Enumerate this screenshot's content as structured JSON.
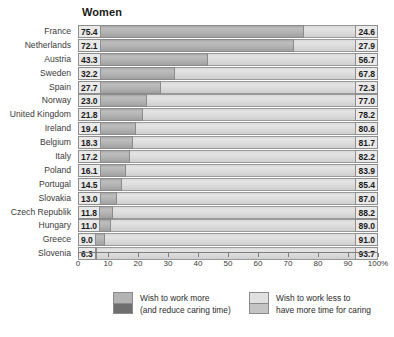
{
  "chart_data": {
    "type": "bar",
    "title": "Women",
    "xlabel": "",
    "ylabel": "",
    "xlim": [
      0,
      100
    ],
    "grid": false,
    "orientation": "horizontal",
    "stacked": true,
    "legend_position": "bottom",
    "axis_unit": "%",
    "categories": [
      "France",
      "Netherlands",
      "Austria",
      "Sweden",
      "Spain",
      "Norway",
      "United Kingdom",
      "Ireland",
      "Belgium",
      "Italy",
      "Poland",
      "Portugal",
      "Slovakia",
      "Czech Republik",
      "Hungary",
      "Greece",
      "Slovenia"
    ],
    "tick_labels": [
      "0",
      "10",
      "20",
      "30",
      "40",
      "50",
      "60",
      "70",
      "80",
      "90",
      "100%"
    ],
    "tick_values": [
      0,
      10,
      20,
      30,
      40,
      50,
      60,
      70,
      80,
      90,
      100
    ],
    "series": [
      {
        "name": "Wish to work more (and reduce caring time)",
        "color": "#b0b0b0",
        "values": [
          75.4,
          72.1,
          43.3,
          32.2,
          27.7,
          23.0,
          21.8,
          19.4,
          18.3,
          17.2,
          16.1,
          14.5,
          13.0,
          11.8,
          11.0,
          9.0,
          6.3
        ]
      },
      {
        "name": "Wish to work less to have more time for caring",
        "color": "#dcdcdc",
        "values": [
          24.6,
          27.9,
          56.7,
          67.8,
          72.3,
          77.0,
          78.2,
          80.6,
          81.7,
          82.2,
          83.9,
          85.4,
          87.0,
          88.2,
          89.0,
          91.0,
          93.7
        ]
      }
    ],
    "value_labels_left": [
      "75.4",
      "72.1",
      "43.3",
      "32.2",
      "27.7",
      "23.0",
      "21.8",
      "19.4",
      "18.3",
      "17.2",
      "16.1",
      "14.5",
      "13.0",
      "11.8",
      "11.0",
      "9.0",
      "6.3"
    ],
    "value_labels_right": [
      "24.6",
      "27.9",
      "56.7",
      "67.8",
      "72.3",
      "77.0",
      "78.2",
      "80.6",
      "81.7",
      "82.2",
      "83.9",
      "85.4",
      "87.0",
      "88.2",
      "89.0",
      "91.0",
      "93.7"
    ]
  },
  "legend": {
    "items": [
      {
        "line1": "Wish to work more",
        "line2": "(and reduce caring time)"
      },
      {
        "line1": "Wish to work less to",
        "line2": "have more time for caring"
      }
    ]
  }
}
